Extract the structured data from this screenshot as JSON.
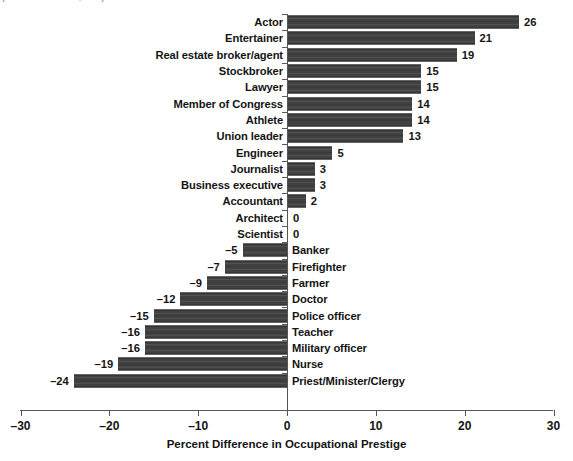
{
  "source_caption": "(Source: Harris Poll, 2014)",
  "chart_data": {
    "type": "bar",
    "orientation": "horizontal",
    "title": "",
    "xlabel": "Percent Difference in Occupational Prestige",
    "ylabel": "",
    "xlim": [
      -30,
      30
    ],
    "xticks": [
      -30,
      -20,
      -10,
      0,
      10,
      20,
      30
    ],
    "xtick_labels": [
      "–30",
      "–20",
      "–10",
      "0",
      "10",
      "20",
      "30"
    ],
    "grid": false,
    "legend": null,
    "bar_color": "#414141",
    "categories": [
      "Actor",
      "Entertainer",
      "Real estate broker/agent",
      "Stockbroker",
      "Lawyer",
      "Member of Congress",
      "Athlete",
      "Union leader",
      "Engineer",
      "Journalist",
      "Business executive",
      "Accountant",
      "Architect",
      "Scientist",
      "Banker",
      "Firefighter",
      "Farmer",
      "Doctor",
      "Police officer",
      "Teacher",
      "Military officer",
      "Nurse",
      "Priest/Minister/Clergy"
    ],
    "values": [
      26,
      21,
      19,
      15,
      15,
      14,
      14,
      13,
      5,
      3,
      3,
      2,
      0,
      0,
      -5,
      -7,
      -9,
      -12,
      -15,
      -16,
      -16,
      -19,
      -24
    ],
    "value_labels": [
      "26",
      "21",
      "19",
      "15",
      "15",
      "14",
      "14",
      "13",
      "5",
      "3",
      "3",
      "2",
      "0",
      "0",
      "–5",
      "–7",
      "–9",
      "–12",
      "–15",
      "–16",
      "–16",
      "–19",
      "–24"
    ]
  }
}
